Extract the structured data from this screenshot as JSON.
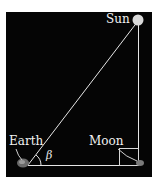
{
  "diagram": {
    "type": "geometry",
    "labels": {
      "sun": "Sun",
      "earth": "Earth",
      "moon": "Moon",
      "angle": "β"
    },
    "nodes": [
      {
        "id": "earth",
        "label": "Earth"
      },
      {
        "id": "moon",
        "label": "Moon"
      },
      {
        "id": "sun",
        "label": "Sun"
      }
    ],
    "edges": [
      {
        "from": "earth",
        "to": "moon"
      },
      {
        "from": "moon",
        "to": "sun"
      },
      {
        "from": "earth",
        "to": "sun"
      }
    ],
    "right_angle_at": "moon",
    "angle_at": "earth",
    "colors": {
      "background": "#050505",
      "lines": "#e6e6e6",
      "text": "#f2f2f2"
    }
  }
}
